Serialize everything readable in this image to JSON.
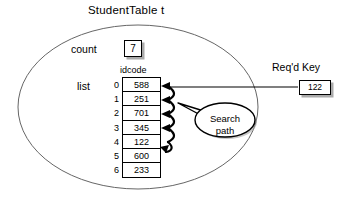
{
  "diagram": {
    "title": "StudentTable  t",
    "container_shape": "ellipse",
    "count": {
      "label": "count",
      "value": "7"
    },
    "list": {
      "label": "list",
      "column_header": "idcode",
      "indices": [
        "0",
        "1",
        "2",
        "3",
        "4",
        "5",
        "6"
      ],
      "values": [
        "588",
        "251",
        "701",
        "345",
        "122",
        "600",
        "233"
      ]
    },
    "required_key": {
      "label": "Req'd Key",
      "value": "122"
    },
    "annotation": {
      "line1": "Search",
      "line2": "path"
    },
    "colors": {
      "outline": "#555555",
      "stroke": "#000000",
      "shadow": "#aaaaaa",
      "background": "#ffffff"
    }
  }
}
